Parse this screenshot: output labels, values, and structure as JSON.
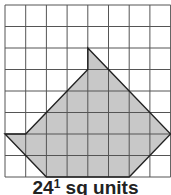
{
  "grid": {
    "columns": 8,
    "rows": 8,
    "origin_x": 5,
    "origin_y": 5,
    "cell_w": 20.7,
    "cell_h": 21.5,
    "line_color": "#555555"
  },
  "shape": {
    "fill_color": "#c8c8c8",
    "stroke_color": "#222222",
    "vertices_grid_units": [
      [
        4,
        2
      ],
      [
        5,
        3
      ],
      [
        8,
        6
      ],
      [
        6,
        8
      ],
      [
        2,
        8
      ],
      [
        0,
        6
      ],
      [
        1,
        6
      ],
      [
        4,
        3
      ]
    ]
  },
  "caption": {
    "whole": "24",
    "fraction": "1",
    "units": " sq units"
  }
}
